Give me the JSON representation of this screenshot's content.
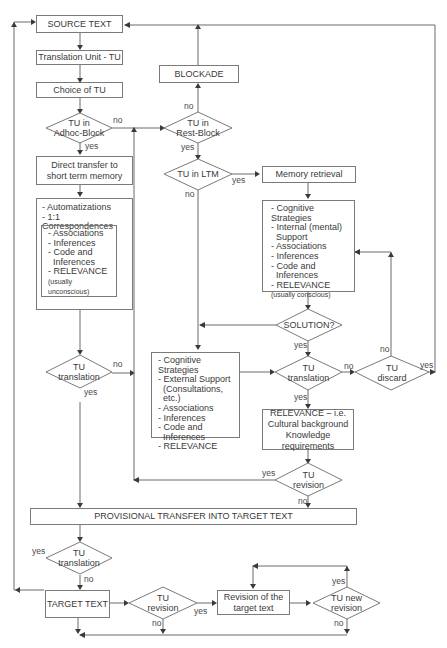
{
  "diagram": {
    "nodes": {
      "source_text": "SOURCE TEXT",
      "translation_unit": "Translation Unit - TU",
      "choice_of_tu": "Choice of TU",
      "tu_adhoc_block": "TU in\nAdhoc-Block",
      "direct_transfer": "Direct transfer to short term memory",
      "auto_box": {
        "items": [
          "- Automatizations",
          "- 1:1 Correspondences"
        ],
        "inner_items": [
          "- Associations",
          "- Inferences",
          "- Code and",
          "  Inferences",
          "- RELEVANCE"
        ],
        "inner_note": "(usually unconscious)"
      },
      "tu_translation_left": "TU\ntranslation",
      "blockade": "BLOCKADE",
      "tu_rest_block": "TU in\nRest-Block",
      "tu_in_ltm": "TU in LTM",
      "memory_retrieval": "Memory retrieval",
      "internal_box": {
        "items": [
          "- Cognitive Strategies",
          "- Internal (mental)",
          "  Support",
          "- Associations",
          "- Inferences",
          "- Code and",
          "  Inferences",
          "- RELEVANCE"
        ],
        "note": "(usually conscious)"
      },
      "solution": "SOLUTION?",
      "external_box": {
        "items": [
          "- Cognitive Strategies",
          "- External Support",
          "  (Consultations, etc.)",
          "- Associations",
          "- Inferences",
          "- Code and",
          "  Inferences",
          "- RELEVANCE"
        ]
      },
      "tu_translation_mid": "TU\ntranslation",
      "tu_discard": "TU\ndiscard",
      "relevance_box": "RELEVANCE – i.e. Cultural background Knowledge requirements",
      "relevance_lines": [
        "RELEVANCE – i.e.",
        "Cultural background",
        "Knowledge requirements"
      ],
      "tu_revision_mid": "TU\nrevision",
      "provisional_transfer": "PROVISIONAL TRANSFER INTO TARGET TEXT",
      "tu_translation_bottom": "TU\ntranslation",
      "target_text": "TARGET TEXT",
      "tu_revision_bottom": "TU\nrevision",
      "revision_target": "Revision of the\ntarget text",
      "tu_new_revision": "TU new\nrevision"
    },
    "edge_labels": {
      "yes": "yes",
      "no": "no"
    }
  }
}
